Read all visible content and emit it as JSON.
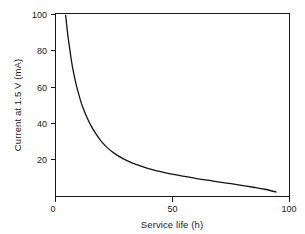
{
  "figure": {
    "background_color": "#ffffff",
    "curve_color": "#141414",
    "axis_color": "#1a1a1a"
  },
  "chart_data": {
    "type": "line",
    "title": "",
    "xlabel": "Service life (h)",
    "ylabel": "Current at 1.5 V (mA)",
    "xlim": [
      0,
      104
    ],
    "ylim": [
      0,
      100
    ],
    "xticks": [
      0,
      50,
      100
    ],
    "xtick_labels": [
      "0",
      "50",
      "100"
    ],
    "yticks": [
      0,
      20,
      40,
      60,
      80,
      100
    ],
    "ytick_labels": [
      "0",
      "20",
      "40",
      "60",
      "80",
      "100"
    ],
    "grid": false,
    "legend": false,
    "series": [
      {
        "name": "Current vs service life",
        "x": [
          4.5,
          5.5,
          6.5,
          7.5,
          9,
          10.5,
          12,
          14,
          16,
          18,
          20,
          23,
          26,
          30,
          34,
          38,
          43,
          48,
          53,
          58,
          64,
          70,
          76,
          82,
          88,
          93,
          98
        ],
        "y": [
          99,
          88,
          79,
          71,
          62,
          55,
          49,
          43,
          38,
          34,
          30.5,
          26.5,
          23.5,
          20.5,
          18.2,
          16.4,
          14.5,
          13,
          11.7,
          10.6,
          9.3,
          8.2,
          7.1,
          6,
          4.8,
          3.7,
          2.2
        ]
      }
    ]
  },
  "axis_labels": {
    "x_title": "Service life (h)",
    "y_title": "Current at 1.5 V (mA)"
  }
}
